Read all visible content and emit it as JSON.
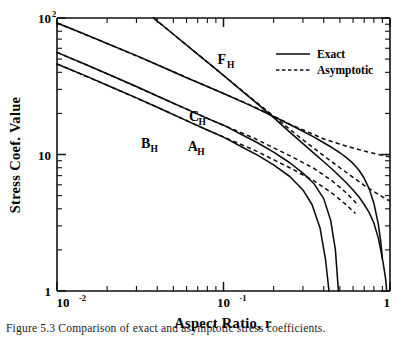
{
  "figure": {
    "caption": "Figure  5.3   Comparison of exact and asymptotic stress coefficients."
  },
  "chart_data": {
    "type": "line",
    "title": "",
    "xlabel": "Aspect Ratio, r",
    "ylabel": "Stress Coef. Value",
    "xscale": "log",
    "yscale": "log",
    "xlim": [
      0.01,
      1.0
    ],
    "ylim": [
      1.0,
      100.0
    ],
    "grid": false,
    "legend": {
      "position": "top-right",
      "entries": [
        {
          "label": "Exact",
          "style": "solid"
        },
        {
          "label": "Asymptotic",
          "style": "dashed"
        }
      ]
    },
    "x_ticks_major": [
      0.01,
      0.1,
      1.0
    ],
    "x_tick_labels": [
      "10-2",
      "10-1",
      "1"
    ],
    "x_tick_label_mantissa": [
      "10",
      "10",
      "1"
    ],
    "x_tick_label_exponent": [
      "-2",
      "-1",
      ""
    ],
    "y_ticks_major": [
      1.0,
      10.0,
      100.0
    ],
    "y_tick_labels": [
      "1",
      "10",
      "102"
    ],
    "y_tick_label_mantissa": [
      "1",
      "10",
      "10"
    ],
    "y_tick_label_exponent": [
      "",
      "",
      "2"
    ],
    "annotations": [
      {
        "text": "F",
        "sub": "H",
        "x": 0.092,
        "y": 46.0
      },
      {
        "text": "C",
        "sub": "H",
        "x": 0.062,
        "y": 17.5
      },
      {
        "text": "B",
        "sub": "H",
        "x": 0.032,
        "y": 11.2
      },
      {
        "text": "A",
        "sub": "H",
        "x": 0.061,
        "y": 10.6
      }
    ],
    "series": [
      {
        "name": "F_H exact",
        "label": "F_H",
        "style": "solid",
        "x": [
          0.038,
          0.05,
          0.065,
          0.08,
          0.1,
          0.13,
          0.16,
          0.2,
          0.25,
          0.3,
          0.35,
          0.4,
          0.45,
          0.5,
          0.55,
          0.6,
          0.65,
          0.7,
          0.75,
          0.8,
          0.85,
          0.88,
          0.91,
          0.93,
          0.945,
          0.955
        ],
        "y": [
          100.0,
          76.0,
          58.5,
          47.5,
          38.0,
          29.0,
          23.5,
          18.6,
          14.6,
          12.0,
          10.2,
          8.85,
          7.8,
          6.9,
          6.15,
          5.5,
          4.9,
          4.3,
          3.75,
          3.15,
          2.45,
          2.0,
          1.6,
          1.35,
          1.18,
          1.0
        ]
      },
      {
        "name": "F_H asymptotic",
        "label": "F_H",
        "style": "dashed",
        "x": [
          0.038,
          0.05,
          0.065,
          0.08,
          0.1,
          0.13,
          0.16,
          0.2,
          0.25,
          0.3,
          0.35,
          0.4,
          0.45,
          0.5,
          0.55,
          0.6,
          0.7,
          0.8,
          0.9,
          1.0
        ],
        "y": [
          100.0,
          76.0,
          58.5,
          47.5,
          38.0,
          29.2,
          23.8,
          19.1,
          15.3,
          12.8,
          11.1,
          9.8,
          8.8,
          8.0,
          7.35,
          6.8,
          5.95,
          5.35,
          4.9,
          4.55
        ]
      },
      {
        "name": "C_H exact",
        "label": "C_H",
        "style": "solid",
        "x": [
          0.01,
          0.014,
          0.02,
          0.03,
          0.04,
          0.06,
          0.08,
          0.1,
          0.13,
          0.16,
          0.2,
          0.25,
          0.3,
          0.35,
          0.4,
          0.45,
          0.5,
          0.55,
          0.6,
          0.65,
          0.7,
          0.75,
          0.8,
          0.85,
          0.88,
          0.9
        ],
        "y": [
          92.0,
          78.0,
          65.0,
          53.0,
          45.5,
          36.5,
          31.5,
          28.0,
          24.3,
          21.6,
          19.0,
          16.6,
          14.8,
          13.4,
          12.2,
          11.2,
          10.3,
          9.45,
          8.6,
          7.7,
          6.7,
          5.6,
          4.4,
          3.1,
          2.3,
          1.72
        ]
      },
      {
        "name": "C_H asymptotic",
        "label": "C_H",
        "style": "dashed",
        "x": [
          0.01,
          0.02,
          0.04,
          0.08,
          0.15,
          0.25,
          0.4,
          0.55,
          0.7,
          0.85,
          1.0
        ],
        "y": [
          92.0,
          65.0,
          45.5,
          31.5,
          22.6,
          16.7,
          13.0,
          11.5,
          10.6,
          10.0,
          9.6
        ]
      },
      {
        "name": "A_H exact",
        "label": "A_H",
        "style": "solid",
        "x": [
          0.01,
          0.015,
          0.02,
          0.03,
          0.04,
          0.06,
          0.08,
          0.1,
          0.13,
          0.16,
          0.2,
          0.25,
          0.3,
          0.35,
          0.4,
          0.44,
          0.47,
          0.49
        ],
        "y": [
          56.0,
          45.5,
          39.0,
          31.5,
          26.8,
          21.5,
          18.4,
          16.4,
          13.9,
          12.2,
          10.4,
          8.7,
          7.3,
          6.1,
          4.75,
          3.3,
          2.0,
          1.0
        ]
      },
      {
        "name": "A_H asymptotic",
        "label": "A_H",
        "style": "dashed",
        "x": [
          0.01,
          0.02,
          0.04,
          0.08,
          0.15,
          0.25,
          0.35,
          0.45,
          0.55,
          0.65
        ],
        "y": [
          56.0,
          39.0,
          26.8,
          18.4,
          13.3,
          9.8,
          7.9,
          6.4,
          5.2,
          4.2
        ]
      },
      {
        "name": "B_H exact",
        "label": "B_H",
        "style": "solid",
        "x": [
          0.01,
          0.015,
          0.02,
          0.03,
          0.04,
          0.06,
          0.08,
          0.1,
          0.13,
          0.16,
          0.2,
          0.25,
          0.3,
          0.34,
          0.38,
          0.41,
          0.43
        ],
        "y": [
          46.0,
          37.5,
          32.2,
          26.0,
          22.2,
          17.7,
          15.1,
          13.4,
          11.3,
          9.9,
          8.4,
          6.9,
          5.5,
          4.3,
          2.9,
          1.7,
          1.0
        ]
      },
      {
        "name": "B_H asymptotic",
        "label": "B_H",
        "style": "dashed",
        "x": [
          0.01,
          0.02,
          0.04,
          0.08,
          0.15,
          0.25,
          0.35,
          0.45,
          0.55,
          0.62
        ],
        "y": [
          46.0,
          32.2,
          22.2,
          15.1,
          10.9,
          8.0,
          6.4,
          5.2,
          4.25,
          3.7
        ]
      }
    ]
  }
}
